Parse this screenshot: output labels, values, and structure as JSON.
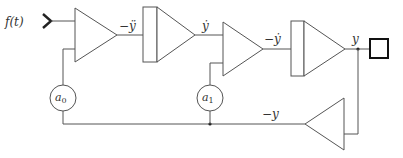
{
  "diagram": {
    "type": "analog computer block diagram",
    "input": {
      "label": "f(t)"
    },
    "signals": {
      "after_summer_1": "−ÿ",
      "after_integrator_1": "ẏ",
      "after_summer_2": "−ẏ",
      "after_integrator_2": "y",
      "feedback": "−y"
    },
    "coefficients": [
      {
        "name": "a0",
        "base": "a",
        "sub": "0"
      },
      {
        "name": "a1",
        "base": "a",
        "sub": "1"
      }
    ],
    "blocks": [
      "summer",
      "integrator",
      "summer",
      "integrator",
      "inverter"
    ],
    "output": {
      "shape": "square"
    },
    "colors": {
      "line": "#555555",
      "text": "#333333",
      "background": "#ffffff"
    }
  }
}
